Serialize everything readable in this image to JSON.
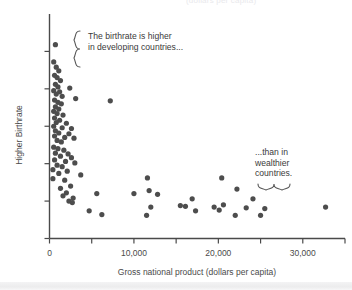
{
  "figure": {
    "clipped_top_text": "(dollars per capita)",
    "background_color": "#ffffff",
    "dot_color": "#4d4d4d",
    "axis_color": "#4a4a4a"
  },
  "annotations": {
    "developing": {
      "text": "The birthrate is higher\nin developing countries...",
      "brace": "left-curly-brace"
    },
    "wealthier": {
      "text": "...than in\nwealthier\ncountries.",
      "brace": "bottom-curly-brace"
    }
  },
  "chart_data": {
    "type": "scatter",
    "title": "",
    "xlabel": "Gross national product (dollars per capita)",
    "ylabel": "Higher Birthrate",
    "xlim": [
      0,
      35000
    ],
    "ylim": [
      0,
      6
    ],
    "grid": false,
    "legend": null,
    "xticks": [
      0,
      5000,
      10000,
      15000,
      20000,
      25000,
      30000,
      35000
    ],
    "xticklabels": [
      "0",
      "",
      "10,000",
      "",
      "20,000",
      "",
      "30,000",
      ""
    ],
    "yticks": [
      0,
      1,
      2,
      3,
      4,
      5
    ],
    "yticklabels": [
      "",
      "",
      "",
      "",
      "",
      ""
    ],
    "points": [
      [
        700,
        5.18
      ],
      [
        500,
        4.72
      ],
      [
        800,
        4.58
      ],
      [
        1100,
        4.48
      ],
      [
        600,
        4.36
      ],
      [
        900,
        4.3
      ],
      [
        1300,
        4.22
      ],
      [
        700,
        4.12
      ],
      [
        1000,
        4.05
      ],
      [
        2400,
        4.02
      ],
      [
        500,
        3.95
      ],
      [
        1200,
        3.92
      ],
      [
        800,
        3.86
      ],
      [
        1500,
        3.8
      ],
      [
        3100,
        3.74
      ],
      [
        600,
        3.7
      ],
      [
        1000,
        3.64
      ],
      [
        1400,
        3.6
      ],
      [
        7200,
        3.68
      ],
      [
        700,
        3.52
      ],
      [
        1100,
        3.46
      ],
      [
        500,
        3.4
      ],
      [
        900,
        3.34
      ],
      [
        1600,
        3.3
      ],
      [
        600,
        3.22
      ],
      [
        1200,
        3.16
      ],
      [
        800,
        3.1
      ],
      [
        2000,
        3.08
      ],
      [
        500,
        3.0
      ],
      [
        1500,
        2.96
      ],
      [
        2600,
        2.94
      ],
      [
        700,
        2.88
      ],
      [
        1100,
        2.82
      ],
      [
        2300,
        2.8
      ],
      [
        600,
        2.74
      ],
      [
        1800,
        2.7
      ],
      [
        2900,
        2.68
      ],
      [
        900,
        2.62
      ],
      [
        1400,
        2.58
      ],
      [
        500,
        2.44
      ],
      [
        1000,
        2.4
      ],
      [
        1700,
        2.36
      ],
      [
        700,
        2.28
      ],
      [
        2200,
        2.26
      ],
      [
        1300,
        2.2
      ],
      [
        2600,
        2.16
      ],
      [
        600,
        2.1
      ],
      [
        1900,
        2.06
      ],
      [
        3000,
        2.02
      ],
      [
        900,
        1.96
      ],
      [
        1500,
        1.92
      ],
      [
        400,
        1.84
      ],
      [
        2100,
        1.8
      ],
      [
        1100,
        1.74
      ],
      [
        3700,
        1.7
      ],
      [
        400,
        1.6
      ],
      [
        1800,
        1.56
      ],
      [
        11600,
        1.62
      ],
      [
        20400,
        1.62
      ],
      [
        2500,
        1.4
      ],
      [
        1300,
        1.34
      ],
      [
        22200,
        1.32
      ],
      [
        2000,
        1.22
      ],
      [
        5600,
        1.2
      ],
      [
        10000,
        1.2
      ],
      [
        12800,
        1.18
      ],
      [
        1600,
        1.14
      ],
      [
        11800,
        1.28
      ],
      [
        2800,
        1.08
      ],
      [
        2300,
        1.0
      ],
      [
        16900,
        1.06
      ],
      [
        24100,
        1.06
      ],
      [
        2700,
        0.96
      ],
      [
        15500,
        0.88
      ],
      [
        16100,
        0.86
      ],
      [
        19500,
        0.84
      ],
      [
        20600,
        0.9
      ],
      [
        23300,
        0.82
      ],
      [
        12000,
        0.84
      ],
      [
        4700,
        0.74
      ],
      [
        17300,
        0.74
      ],
      [
        20100,
        0.76
      ],
      [
        25500,
        0.8
      ],
      [
        6200,
        0.64
      ],
      [
        11500,
        0.62
      ],
      [
        22000,
        0.62
      ],
      [
        25000,
        0.62
      ],
      [
        32700,
        0.84
      ]
    ]
  }
}
